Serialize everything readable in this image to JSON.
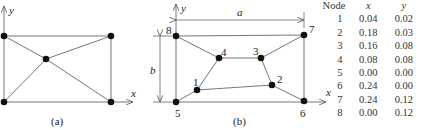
{
  "figure_a": {
    "caption": "(a)",
    "x_axis_label": "x",
    "y_axis_label": "y"
  },
  "figure_b": {
    "caption": "(b)",
    "x_axis_label": "x",
    "y_axis_label": "y",
    "dimension_a": "a",
    "dimension_b": "b",
    "node_labels": [
      "1",
      "2",
      "3",
      "4",
      "5",
      "6",
      "7",
      "8"
    ]
  },
  "node_table": {
    "headers": [
      "Node",
      "x",
      "y"
    ],
    "rows": [
      {
        "node": "1",
        "x": "0.04",
        "y": "0.02"
      },
      {
        "node": "2",
        "x": "0.18",
        "y": "0.03"
      },
      {
        "node": "3",
        "x": "0.16",
        "y": "0.08"
      },
      {
        "node": "4",
        "x": "0.08",
        "y": "0.08"
      },
      {
        "node": "5",
        "x": "0.00",
        "y": "0.00"
      },
      {
        "node": "6",
        "x": "0.24",
        "y": "0.00"
      },
      {
        "node": "7",
        "x": "0.24",
        "y": "0.12"
      },
      {
        "node": "8",
        "x": "0.00",
        "y": "0.12"
      }
    ]
  }
}
